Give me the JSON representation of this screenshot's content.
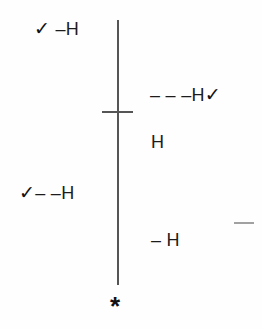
{
  "diagram": {
    "labels": {
      "top_left": {
        "check": "✓",
        "text": " –H"
      },
      "top_right": {
        "text": "– – –H",
        "check": "✓"
      },
      "mid_right": {
        "text": "H"
      },
      "mid_left": {
        "check": "✓",
        "text": "– –H"
      },
      "bottom_right": {
        "text": "– H"
      }
    },
    "marker": "*",
    "colors": {
      "line": "#555555",
      "text": "#1c1c1c",
      "background": "#fefefe"
    }
  }
}
